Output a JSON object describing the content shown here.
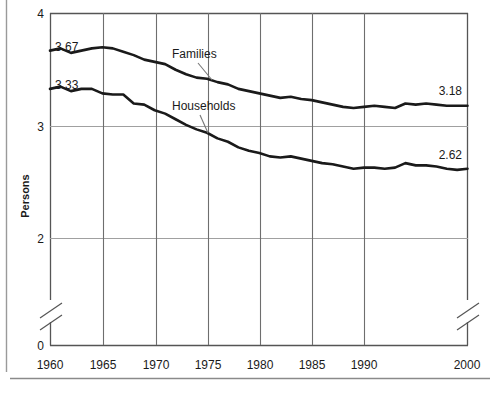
{
  "chart_data": {
    "type": "line",
    "title": "",
    "xlabel": "",
    "ylabel": "Persons",
    "ylim": [
      2,
      4
    ],
    "y_ticks": [
      "4",
      "3",
      "2",
      "0"
    ],
    "y_axis_break": true,
    "x_ticks": [
      "1960",
      "1965",
      "1970",
      "1975",
      "1980",
      "1985",
      "1990",
      "2000"
    ],
    "x_axis_break": true,
    "grid": true,
    "legend_position": "inline-annotations",
    "series": [
      {
        "name": "Families",
        "label": "Families",
        "start_label": "3.67",
        "end_label": "3.18",
        "color": "#1a1a1a",
        "x": [
          1960,
          1961,
          1962,
          1963,
          1964,
          1965,
          1966,
          1967,
          1968,
          1969,
          1970,
          1971,
          1972,
          1973,
          1974,
          1975,
          1976,
          1977,
          1978,
          1979,
          1980,
          1981,
          1982,
          1983,
          1984,
          1985,
          1986,
          1987,
          1988,
          1989,
          1990,
          1991,
          1992,
          1993,
          1994,
          1995,
          1996,
          1997,
          1998,
          1999,
          2000
        ],
        "values": [
          3.67,
          3.69,
          3.65,
          3.67,
          3.69,
          3.7,
          3.69,
          3.66,
          3.63,
          3.59,
          3.57,
          3.55,
          3.5,
          3.46,
          3.43,
          3.42,
          3.39,
          3.37,
          3.33,
          3.31,
          3.29,
          3.27,
          3.25,
          3.26,
          3.24,
          3.23,
          3.21,
          3.19,
          3.17,
          3.16,
          3.17,
          3.18,
          3.17,
          3.16,
          3.2,
          3.19,
          3.2,
          3.19,
          3.18,
          3.18,
          3.18
        ]
      },
      {
        "name": "Households",
        "label": "Households",
        "start_label": "3.33",
        "end_label": "2.62",
        "color": "#1a1a1a",
        "x": [
          1960,
          1961,
          1962,
          1963,
          1964,
          1965,
          1966,
          1967,
          1968,
          1969,
          1970,
          1971,
          1972,
          1973,
          1974,
          1975,
          1976,
          1977,
          1978,
          1979,
          1980,
          1981,
          1982,
          1983,
          1984,
          1985,
          1986,
          1987,
          1988,
          1989,
          1990,
          1991,
          1992,
          1993,
          1994,
          1995,
          1996,
          1997,
          1998,
          1999,
          2000
        ],
        "values": [
          3.33,
          3.35,
          3.31,
          3.33,
          3.33,
          3.29,
          3.28,
          3.28,
          3.2,
          3.19,
          3.14,
          3.11,
          3.06,
          3.01,
          2.97,
          2.94,
          2.89,
          2.86,
          2.81,
          2.78,
          2.76,
          2.73,
          2.72,
          2.73,
          2.71,
          2.69,
          2.67,
          2.66,
          2.64,
          2.62,
          2.63,
          2.63,
          2.62,
          2.63,
          2.67,
          2.65,
          2.65,
          2.64,
          2.62,
          2.61,
          2.62
        ]
      }
    ],
    "annotations": [
      {
        "text": "Families",
        "target_series": "Families"
      },
      {
        "text": "Households",
        "target_series": "Households"
      }
    ]
  },
  "axis": {
    "y_label": "Persons",
    "y_tick_4": "4",
    "y_tick_3": "3",
    "y_tick_2": "2",
    "y_tick_0": "0",
    "x_tick_1960": "1960",
    "x_tick_1965": "1965",
    "x_tick_1970": "1970",
    "x_tick_1975": "1975",
    "x_tick_1980": "1980",
    "x_tick_1985": "1985",
    "x_tick_1990": "1990",
    "x_tick_2000": "2000"
  },
  "labels": {
    "families": "Families",
    "households": "Households",
    "families_start": "3.67",
    "families_end": "3.18",
    "households_start": "3.33",
    "households_end": "2.62"
  },
  "colors": {
    "line": "#1a1a1a",
    "grid": "#6e6e6e",
    "grid_light": "#9a9a9a",
    "frame": "#4a4a4a",
    "rule": "#8a8a8a",
    "background": "#ffffff"
  }
}
